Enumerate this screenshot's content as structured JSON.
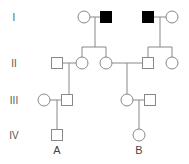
{
  "diagram": {
    "type": "pedigree",
    "generations": [
      {
        "label": "I",
        "y": 17
      },
      {
        "label": "II",
        "y": 63
      },
      {
        "label": "III",
        "y": 100
      },
      {
        "label": "IV",
        "y": 135
      }
    ],
    "individuals": [
      {
        "id": "I-1",
        "sex": "female",
        "affected": false,
        "x": 84,
        "y": 17
      },
      {
        "id": "I-2",
        "sex": "male",
        "affected": true,
        "x": 106,
        "y": 17
      },
      {
        "id": "I-3",
        "sex": "male",
        "affected": true,
        "x": 148,
        "y": 17
      },
      {
        "id": "I-4",
        "sex": "female",
        "affected": false,
        "x": 172,
        "y": 17
      },
      {
        "id": "II-1",
        "sex": "male",
        "affected": false,
        "x": 57,
        "y": 63
      },
      {
        "id": "II-2",
        "sex": "female",
        "affected": false,
        "x": 82,
        "y": 63
      },
      {
        "id": "II-3",
        "sex": "female",
        "affected": false,
        "x": 106,
        "y": 63
      },
      {
        "id": "II-4",
        "sex": "male",
        "affected": false,
        "x": 148,
        "y": 63
      },
      {
        "id": "II-5",
        "sex": "female",
        "affected": false,
        "x": 172,
        "y": 63
      },
      {
        "id": "III-1",
        "sex": "female",
        "affected": false,
        "x": 44,
        "y": 100
      },
      {
        "id": "III-2",
        "sex": "male",
        "affected": false,
        "x": 67,
        "y": 100
      },
      {
        "id": "III-3",
        "sex": "female",
        "affected": false,
        "x": 127,
        "y": 100
      },
      {
        "id": "III-4",
        "sex": "male",
        "affected": false,
        "x": 150,
        "y": 100
      },
      {
        "id": "IV-1",
        "sex": "male",
        "affected": false,
        "x": 57,
        "y": 135,
        "label": "A"
      },
      {
        "id": "IV-2",
        "sex": "female",
        "affected": false,
        "x": 139,
        "y": 135,
        "label": "B"
      }
    ],
    "labels": {
      "A": "A",
      "B": "B"
    },
    "colors": {
      "line": "#888888",
      "affected": "#000000",
      "unaffected": "#ffffff"
    }
  }
}
